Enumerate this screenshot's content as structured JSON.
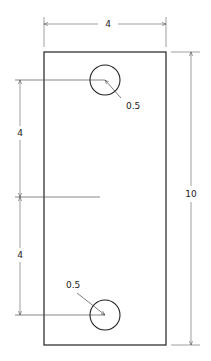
{
  "drawing": {
    "type": "technical-drawing",
    "plate": {
      "width": 4,
      "height": 10
    },
    "dimensions": {
      "top_width": "4",
      "right_height": "10",
      "left_upper_spacing": "4",
      "left_lower_spacing": "4",
      "upper_hole_radius": "0.5",
      "lower_hole_radius": "0.5"
    },
    "holes": [
      {
        "name": "upper-hole",
        "radius_label": "0.5"
      },
      {
        "name": "lower-hole",
        "radius_label": "0.5"
      }
    ],
    "colors": {
      "line": "#222222",
      "dim_line": "#555555",
      "background": "#ffffff"
    }
  }
}
